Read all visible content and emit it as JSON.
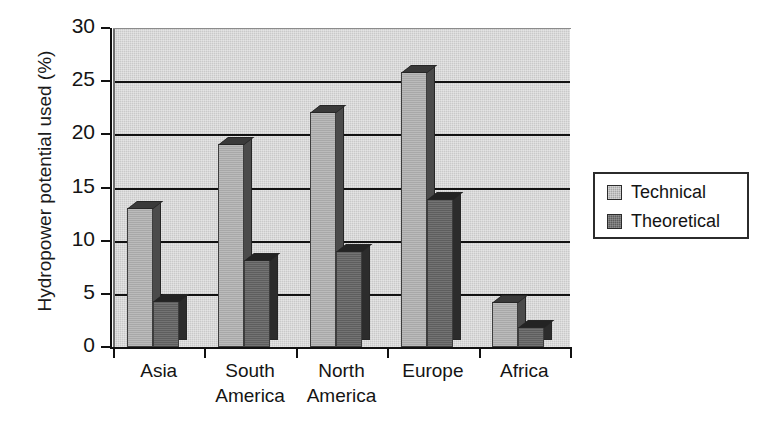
{
  "chart_data": {
    "type": "bar",
    "title": "",
    "xlabel": "",
    "ylabel": "Hydropower potential used (%)",
    "categories": [
      "Asia",
      "South America",
      "North America",
      "Europe",
      "Africa"
    ],
    "series": [
      {
        "name": "Technical",
        "values": [
          13.1,
          19.1,
          22.1,
          25.9,
          4.2
        ]
      },
      {
        "name": "Theoretical",
        "values": [
          4.3,
          8.2,
          9.0,
          13.9,
          1.9
        ]
      }
    ],
    "ylim": [
      0,
      30
    ],
    "yticks": [
      0,
      5,
      10,
      15,
      20,
      25,
      30
    ],
    "ytick_labels": [
      "0",
      "5",
      "10",
      "15",
      "20",
      "25",
      "30"
    ],
    "grid": true,
    "grid_axis": "y",
    "legend_position": "right",
    "colors": {
      "technical": "#a8a8a8",
      "theoretical": "#5e5e5e",
      "plot_background": "#c9c9c9",
      "axis": "#111111",
      "text": "#141414"
    }
  },
  "legend": {
    "entries": [
      {
        "label": "Technical"
      },
      {
        "label": "Theoretical"
      }
    ]
  }
}
